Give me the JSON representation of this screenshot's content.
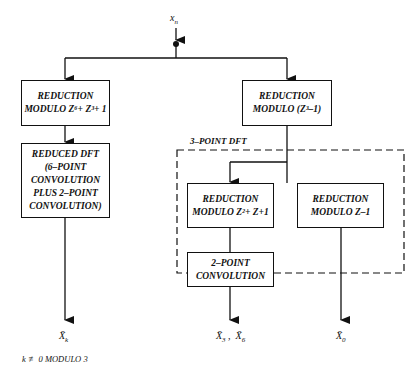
{
  "diagram": {
    "input": {
      "label": "x",
      "sub": "n"
    },
    "boxes": {
      "left_reduction": {
        "line1": "REDUCTION",
        "line2": "MODULO  Z⁶+ Z³+ 1"
      },
      "reduced_dft": {
        "line1": "REDUCED  DFT",
        "line2": "(6–POINT",
        "line3": "CONVOLUTION",
        "line4": "PLUS  2–POINT",
        "line5": "CONVOLUTION)"
      },
      "right_reduction": {
        "line1": "REDUCTION",
        "line2": "MODULO  (Z³–1)"
      },
      "reduction_z2": {
        "line1": "REDUCTION",
        "line2": "MODULO  Z²+ Z+1"
      },
      "reduction_z1": {
        "line1": "REDUCTION",
        "line2": "MODULO  Z–1"
      },
      "two_point": {
        "line1": "2–POINT",
        "line2": "CONVOLUTION"
      }
    },
    "group_label": "3–POINT  DFT",
    "outputs": {
      "xk": {
        "label": "X̄",
        "sub": "k"
      },
      "x36": {
        "a": "X̄",
        "a_sub": "3",
        "sep": " ,  ",
        "b": "X̄",
        "b_sub": "6"
      },
      "x0": {
        "label": "X̄",
        "sub": "0"
      }
    },
    "footnote": "k ≢ 0  MODULO  3"
  }
}
